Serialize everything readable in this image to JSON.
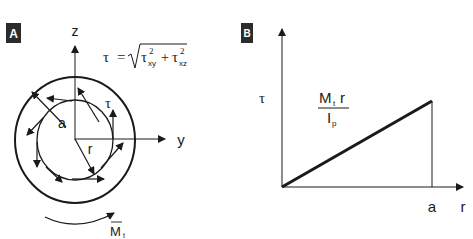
{
  "panels": [
    {
      "badge": "A",
      "axes": {
        "vertical": "z",
        "horizontal": "y"
      },
      "formula": {
        "lhs": "τ",
        "equals": "=",
        "sqrt_symbol": "√",
        "term1_base": "τ",
        "term1_sup": "2",
        "term1_sub": "xy",
        "plus": "+",
        "term2_base": "τ",
        "term2_sup": "2",
        "term2_sub": "xz"
      },
      "labels": {
        "outer_radius": "a",
        "inner_radius": "r",
        "shear_stress": "τ",
        "torque_base": "M",
        "torque_sub": "t"
      }
    },
    {
      "badge": "B",
      "axes": {
        "vertical": "τ",
        "horizontal": "r"
      },
      "x_tick": "a",
      "fraction": {
        "num_base": "M",
        "num_sub": "t",
        "num_var": "r",
        "den_base": "I",
        "den_sub": "p"
      }
    }
  ],
  "colors": {
    "ink": "#1a1a1a",
    "badge_bg": "#2b2b2b",
    "badge_text": "#ffffff",
    "background": "#ffffff"
  }
}
